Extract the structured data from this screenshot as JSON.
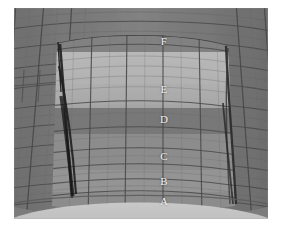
{
  "figure": {
    "background_color": "#ffffff",
    "canvas": {
      "left": 14,
      "top": 8,
      "width": 254,
      "height": 211
    },
    "colors": {
      "outer_shell": "#7c7c7c",
      "outer_shell_dark": "#6f6f6f",
      "panel_mid": "#8a8a8a",
      "panel_light": "#a9a9a9",
      "panel_bright": "#b4b4b4",
      "panel_dark_band": "#767676",
      "band_c": "#8d8d8d",
      "band_b": "#939393",
      "band_a": "#8f8f8f",
      "bottom_arc": "#c4c4c4",
      "mesh_line": "#4a4a4a",
      "mesh_line_soft": "#6a6a6a",
      "seam_dark": "#2b2b2b",
      "label_text": "#f2f2f2"
    },
    "zones": [
      {
        "id": "F",
        "label": "F",
        "x": 150,
        "y": 33
      },
      {
        "id": "E",
        "label": "E",
        "x": 150,
        "y": 81
      },
      {
        "id": "D",
        "label": "D",
        "x": 150,
        "y": 111
      },
      {
        "id": "C",
        "label": "C",
        "x": 150,
        "y": 148
      },
      {
        "id": "B",
        "label": "B",
        "x": 150,
        "y": 173
      },
      {
        "id": "A",
        "label": "A",
        "x": 150,
        "y": 193
      }
    ]
  }
}
